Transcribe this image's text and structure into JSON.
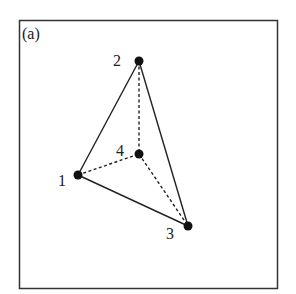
{
  "panel_label": "(a)",
  "nodes": [
    {
      "id": "1",
      "label": "1",
      "x": 78,
      "y": 175,
      "lx": 58,
      "ly": 186
    },
    {
      "id": "2",
      "label": "2",
      "x": 139,
      "y": 61,
      "lx": 113,
      "ly": 66
    },
    {
      "id": "3",
      "label": "3",
      "x": 188,
      "y": 226,
      "lx": 166,
      "ly": 239
    },
    {
      "id": "4",
      "label": "4",
      "x": 139,
      "y": 154,
      "lx": 116,
      "ly": 156
    }
  ],
  "edges": [
    {
      "from": "1",
      "to": "2",
      "style": "solid"
    },
    {
      "from": "2",
      "to": "3",
      "style": "solid"
    },
    {
      "from": "1",
      "to": "3",
      "style": "solid"
    },
    {
      "from": "2",
      "to": "4",
      "style": "dashed"
    },
    {
      "from": "1",
      "to": "4",
      "style": "dashed"
    },
    {
      "from": "4",
      "to": "3",
      "style": "dashed"
    }
  ]
}
